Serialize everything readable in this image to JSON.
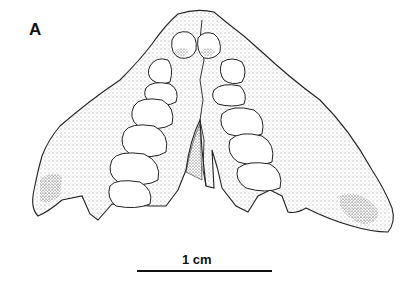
{
  "figure": {
    "panel_label": "A",
    "scale_bar": {
      "label": "1 cm"
    }
  }
}
